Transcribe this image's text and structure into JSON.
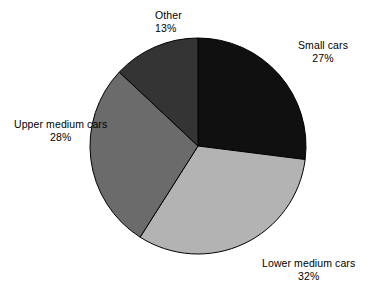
{
  "chart_data": {
    "type": "pie",
    "title": "",
    "subtitle": "",
    "xlabel": "",
    "ylabel": "",
    "legend_position": "outside-labels",
    "grid": false,
    "start_angle_deg": 0,
    "direction": "clockwise",
    "center": {
      "x": 198,
      "y": 146
    },
    "radius": 108,
    "categories": [
      "Small cars",
      "Lower medium cars",
      "Upper medium cars",
      "Other"
    ],
    "values": [
      27,
      32,
      28,
      13
    ],
    "value_suffix": "%",
    "slices": [
      {
        "label": "Small cars",
        "value": 27,
        "value_text": "27%",
        "color": "#101010",
        "start_deg": 0,
        "end_deg": 97.2
      },
      {
        "label": "Lower medium cars",
        "value": 32,
        "value_text": "32%",
        "color": "#b3b3b3",
        "start_deg": 97.2,
        "end_deg": 212.4
      },
      {
        "label": "Upper medium cars",
        "value": 28,
        "value_text": "28%",
        "color": "#6b6b6b",
        "start_deg": 212.4,
        "end_deg": 313.2
      },
      {
        "label": "Other",
        "value": 13,
        "value_text": "13%",
        "color": "#343434",
        "start_deg": 313.2,
        "end_deg": 360
      }
    ],
    "outline_color": "#000000",
    "background": "#ffffff"
  },
  "labels": {
    "small_cars": {
      "name": "Small cars",
      "value": "27%"
    },
    "lower_medium_cars": {
      "name": "Lower medium cars",
      "value": "32%"
    },
    "upper_medium_cars": {
      "name": "Upper medium cars",
      "value": "28%"
    },
    "other": {
      "name": "Other",
      "value": "13%"
    }
  }
}
